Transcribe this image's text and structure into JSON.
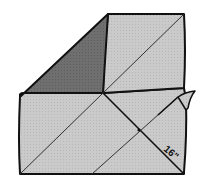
{
  "diagram": {
    "dimension_label": "16\"",
    "colors": {
      "paper": "#c9c9c9",
      "folded_corner": "#6e6e6e",
      "outline": "#111111",
      "background": "#ffffff"
    },
    "parts": [
      "folded-corner-triangle",
      "top-right-panel",
      "bottom-left-panel",
      "right-flap",
      "main-diagonal",
      "measure-diagonal",
      "secondary-diagonal"
    ]
  }
}
